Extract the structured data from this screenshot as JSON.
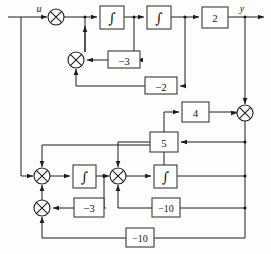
{
  "diagram": {
    "type": "signal-flow-block-diagram",
    "canvas": {
      "width": 271,
      "height": 254
    },
    "colors": {
      "background": "#fdfdfc",
      "wire": "#1c1c1c",
      "block_stroke": "#3a3a3a",
      "block_fill": "#ffffff",
      "text": "#15140f"
    },
    "signals": {
      "input_label": "u",
      "output_label": "y"
    },
    "gain_blocks": [
      {
        "id": "gain-minus-3-upper",
        "label": "−3",
        "x": 108,
        "y": 51,
        "w": 32,
        "h": 17
      },
      {
        "id": "gain-minus-2",
        "label": "−2",
        "x": 145,
        "y": 77,
        "w": 32,
        "h": 17
      },
      {
        "id": "gain-2",
        "label": "2",
        "x": 202,
        "y": 7,
        "w": 26,
        "h": 21
      },
      {
        "id": "gain-4",
        "label": "4",
        "x": 182,
        "y": 102,
        "w": 27,
        "h": 20
      },
      {
        "id": "gain-5",
        "label": "5",
        "x": 150,
        "y": 132,
        "w": 28,
        "h": 20
      },
      {
        "id": "gain-minus-3-lower",
        "label": "−3",
        "x": 74,
        "y": 198,
        "w": 30,
        "h": 19
      },
      {
        "id": "gain-minus-10-middle",
        "label": "−10",
        "x": 152,
        "y": 198,
        "w": 28,
        "h": 19
      },
      {
        "id": "gain-minus-10-bottom",
        "label": "−10",
        "x": 126,
        "y": 228,
        "w": 28,
        "h": 19
      }
    ],
    "integrator_blocks": [
      {
        "id": "integrator-1",
        "label": "∫",
        "x": 100,
        "y": 6,
        "w": 24,
        "h": 23
      },
      {
        "id": "integrator-2",
        "label": "∫",
        "x": 147,
        "y": 6,
        "w": 24,
        "h": 23
      },
      {
        "id": "integrator-3",
        "label": "∫",
        "x": 73,
        "y": 165,
        "w": 23,
        "h": 23
      },
      {
        "id": "integrator-4",
        "label": "∫",
        "x": 154,
        "y": 165,
        "w": 23,
        "h": 23
      }
    ],
    "summing_junctions": [
      {
        "id": "sum-input",
        "cx": 56,
        "cy": 17,
        "r": 8
      },
      {
        "id": "sum-upper-feedback",
        "cx": 76,
        "cy": 60,
        "r": 8
      },
      {
        "id": "sum-output-mix",
        "cx": 245,
        "cy": 113,
        "r": 8
      },
      {
        "id": "sum-lower-left",
        "cx": 42,
        "cy": 176,
        "r": 8
      },
      {
        "id": "sum-lower-mid",
        "cx": 118,
        "cy": 176,
        "r": 8
      },
      {
        "id": "sum-lower-feedback",
        "cx": 42,
        "cy": 208,
        "r": 8
      }
    ]
  }
}
